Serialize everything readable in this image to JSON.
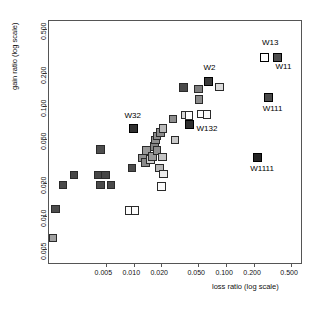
{
  "chart_data": {
    "type": "scatter",
    "title": "",
    "xlabel": "loss ratio   (log scale)",
    "ylabel": "gain ratio   (log scale)",
    "x_scale": "log",
    "y_scale": "log",
    "xticks": [
      "0.005",
      "0.010",
      "0.020",
      "0.050",
      "0.100",
      "0.200",
      "0.500"
    ],
    "xtick_values": [
      0.005,
      0.01,
      0.02,
      0.05,
      0.1,
      0.2,
      0.5
    ],
    "yticks": [
      "0.005",
      "0.010",
      "0.020",
      "0.050",
      "0.100",
      "0.200",
      "0.500"
    ],
    "ytick_values": [
      0.005,
      0.01,
      0.02,
      0.05,
      0.1,
      0.2,
      0.5
    ],
    "xlim": [
      0.0012,
      0.62
    ],
    "ylim": [
      0.0038,
      0.6
    ],
    "grid": false,
    "legend": "none",
    "marker": "square",
    "points": [
      {
        "x": 0.00135,
        "y": 0.0063,
        "fill": "#a0a0a0",
        "label": "",
        "highlight": false
      },
      {
        "x": 0.00145,
        "y": 0.0115,
        "fill": "#4c4c4c",
        "label": "",
        "highlight": false
      },
      {
        "x": 0.00175,
        "y": 0.019,
        "fill": "#4a4a4a",
        "label": "",
        "highlight": false
      },
      {
        "x": 0.0023,
        "y": 0.0235,
        "fill": "#474747",
        "label": "",
        "highlight": false
      },
      {
        "x": 0.0044,
        "y": 0.04,
        "fill": "#4e4e4e",
        "label": "",
        "highlight": false
      },
      {
        "x": 0.0042,
        "y": 0.0235,
        "fill": "#464646",
        "label": "",
        "highlight": false
      },
      {
        "x": 0.005,
        "y": 0.0235,
        "fill": "#464646",
        "label": "",
        "highlight": false
      },
      {
        "x": 0.0044,
        "y": 0.019,
        "fill": "#4a4a4a",
        "label": "",
        "highlight": false
      },
      {
        "x": 0.0057,
        "y": 0.019,
        "fill": "#4a4a4a",
        "label": "",
        "highlight": false
      },
      {
        "x": 0.0091,
        "y": 0.0112,
        "fill": "#fcfcfc",
        "label": "",
        "highlight": false
      },
      {
        "x": 0.0104,
        "y": 0.0112,
        "fill": "#fcfcfc",
        "label": "",
        "highlight": false
      },
      {
        "x": 0.0096,
        "y": 0.0272,
        "fill": "#4b4b4b",
        "label": "",
        "highlight": false
      },
      {
        "x": 0.01,
        "y": 0.0625,
        "fill": "#303030",
        "label": "W32",
        "highlight": true
      },
      {
        "x": 0.0125,
        "y": 0.0335,
        "fill": "#909090",
        "label": "",
        "highlight": false
      },
      {
        "x": 0.0135,
        "y": 0.0305,
        "fill": "#8a8a8a",
        "label": "",
        "highlight": false
      },
      {
        "x": 0.0138,
        "y": 0.039,
        "fill": "#999999",
        "label": "",
        "highlight": false
      },
      {
        "x": 0.0152,
        "y": 0.0325,
        "fill": "#cfcfcf",
        "label": "",
        "highlight": false
      },
      {
        "x": 0.016,
        "y": 0.0345,
        "fill": "#9a9a9a",
        "label": "",
        "highlight": false
      },
      {
        "x": 0.0168,
        "y": 0.0425,
        "fill": "#848484",
        "label": "",
        "highlight": false
      },
      {
        "x": 0.0172,
        "y": 0.049,
        "fill": "#8e8e8e",
        "label": "",
        "highlight": false
      },
      {
        "x": 0.0178,
        "y": 0.053,
        "fill": "#8c8c8c",
        "label": "",
        "highlight": false
      },
      {
        "x": 0.018,
        "y": 0.039,
        "fill": "#8f8f8f",
        "label": "",
        "highlight": false
      },
      {
        "x": 0.019,
        "y": 0.0272,
        "fill": "#b6b6b6",
        "label": "",
        "highlight": false
      },
      {
        "x": 0.0196,
        "y": 0.057,
        "fill": "#8b8b8b",
        "label": "",
        "highlight": false
      },
      {
        "x": 0.0207,
        "y": 0.062,
        "fill": "#b9b9b9",
        "label": "",
        "highlight": false
      },
      {
        "x": 0.0205,
        "y": 0.034,
        "fill": "#c4c4c4",
        "label": "",
        "highlight": false
      },
      {
        "x": 0.021,
        "y": 0.024,
        "fill": "#ececec",
        "label": "",
        "highlight": false
      },
      {
        "x": 0.02,
        "y": 0.0185,
        "fill": "#fbfbfb",
        "label": "",
        "highlight": false
      },
      {
        "x": 0.0265,
        "y": 0.0755,
        "fill": "#8d8d8d",
        "label": "",
        "highlight": false
      },
      {
        "x": 0.028,
        "y": 0.049,
        "fill": "#c9c9c9",
        "label": "",
        "highlight": false
      },
      {
        "x": 0.0345,
        "y": 0.146,
        "fill": "#4a4a4a",
        "label": "",
        "highlight": false
      },
      {
        "x": 0.036,
        "y": 0.082,
        "fill": "#d6d6d6",
        "label": "",
        "highlight": false
      },
      {
        "x": 0.0395,
        "y": 0.081,
        "fill": "#fcfcfc",
        "label": "",
        "highlight": false
      },
      {
        "x": 0.04,
        "y": 0.068,
        "fill": "#2e2e2e",
        "label": "W132",
        "highlight": true
      },
      {
        "x": 0.05,
        "y": 0.142,
        "fill": "#7e7e7e",
        "label": "",
        "highlight": false
      },
      {
        "x": 0.051,
        "y": 0.114,
        "fill": "#8b8b8b",
        "label": "",
        "highlight": false
      },
      {
        "x": 0.053,
        "y": 0.084,
        "fill": "#fbfbfb",
        "label": "",
        "highlight": false
      },
      {
        "x": 0.062,
        "y": 0.083,
        "fill": "#fbfbfb",
        "label": "",
        "highlight": false
      },
      {
        "x": 0.064,
        "y": 0.166,
        "fill": "#3a3a3a",
        "label": "W2",
        "highlight": true
      },
      {
        "x": 0.084,
        "y": 0.148,
        "fill": "#dcdcdc",
        "label": "",
        "highlight": false
      },
      {
        "x": 0.26,
        "y": 0.272,
        "fill": "#ffffff",
        "label": "W13",
        "highlight": true
      },
      {
        "x": 0.355,
        "y": 0.272,
        "fill": "#4d4d4d",
        "label": "W11",
        "highlight": true
      },
      {
        "x": 0.285,
        "y": 0.118,
        "fill": "#4a4a4a",
        "label": "W111",
        "highlight": true
      },
      {
        "x": 0.215,
        "y": 0.034,
        "fill": "#242424",
        "label": "W1111",
        "highlight": true
      }
    ],
    "labels": [
      {
        "text": "W13",
        "x": 0.26,
        "y": 0.272,
        "dx": -3,
        "dy": -15
      },
      {
        "text": "W11",
        "x": 0.355,
        "y": 0.272,
        "dx": -2,
        "dy": 9
      },
      {
        "text": "W111",
        "x": 0.285,
        "y": 0.118,
        "dx": -6,
        "dy": 11
      },
      {
        "text": "W1111",
        "x": 0.215,
        "y": 0.034,
        "dx": -7,
        "dy": 12
      },
      {
        "text": "W2",
        "x": 0.064,
        "y": 0.166,
        "dx": -5,
        "dy": -13
      },
      {
        "text": "W32",
        "x": 0.01,
        "y": 0.0625,
        "dx": -9,
        "dy": -12
      },
      {
        "text": "W132",
        "x": 0.04,
        "y": 0.068,
        "dx": 7,
        "dy": 5
      }
    ]
  }
}
